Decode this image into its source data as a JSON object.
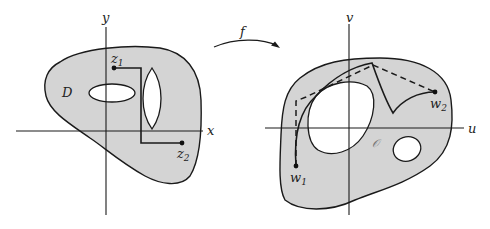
{
  "figure": {
    "left_panel": {
      "axes": {
        "horizontal": "x",
        "vertical": "y"
      },
      "region_label": "D",
      "points": [
        {
          "name": "z",
          "subscript": "1"
        },
        {
          "name": "z",
          "subscript": "2"
        }
      ]
    },
    "mapping": {
      "label": "f"
    },
    "right_panel": {
      "axes": {
        "horizontal": "u",
        "vertical": "v"
      },
      "region_label": "𝒪",
      "points": [
        {
          "name": "w",
          "subscript": "1"
        },
        {
          "name": "w",
          "subscript": "2"
        }
      ]
    },
    "colors": {
      "region_fill": "#d4d4d4",
      "stroke": "#1a1a1a",
      "background": "#ffffff"
    }
  }
}
